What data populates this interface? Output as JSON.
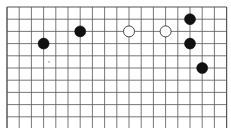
{
  "board": {
    "cols": 19,
    "rows": 11,
    "origin_x": 7,
    "origin_y": 7,
    "spacing": 12.2,
    "line_color": "#555555",
    "background": "#ffffff",
    "stone_radius": 5.5
  },
  "stones": [
    {
      "color": "black",
      "col": 3,
      "row": 3
    },
    {
      "color": "black",
      "col": 6,
      "row": 2
    },
    {
      "color": "white",
      "col": 10,
      "row": 2
    },
    {
      "color": "white",
      "col": 13,
      "row": 2
    },
    {
      "color": "black",
      "col": 15,
      "row": 1
    },
    {
      "color": "black",
      "col": 15,
      "row": 3
    },
    {
      "color": "black",
      "col": 16,
      "row": 5
    }
  ],
  "marks": [
    {
      "type": "dot",
      "x": 49,
      "y": 62
    }
  ]
}
